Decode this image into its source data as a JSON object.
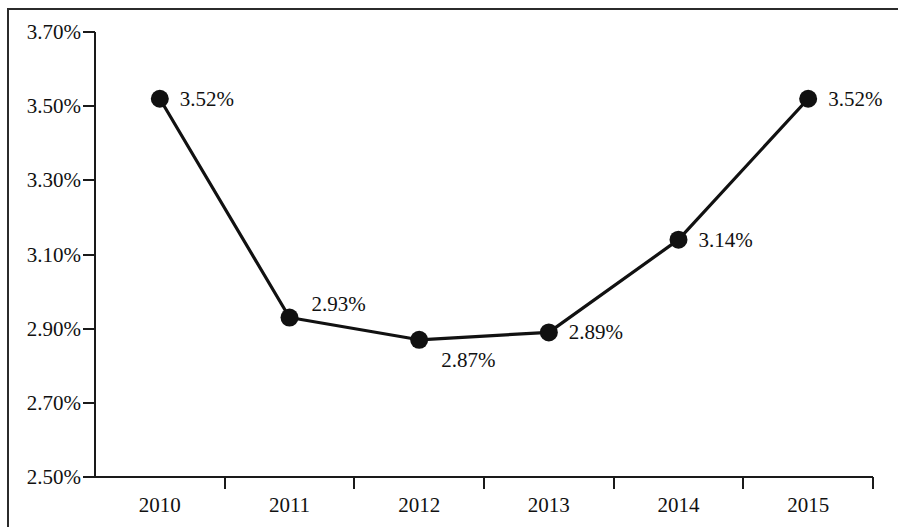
{
  "chart_data": {
    "type": "line",
    "title": "",
    "subtitle": "",
    "xlabel": "",
    "ylabel": "",
    "categories": [
      "2010",
      "2011",
      "2012",
      "2013",
      "2014",
      "2015"
    ],
    "values": [
      3.52,
      2.93,
      2.87,
      2.89,
      3.14,
      3.52
    ],
    "value_labels": [
      "3.52%",
      "2.93%",
      "2.87%",
      "2.89%",
      "3.14%",
      "3.52%"
    ],
    "series": [
      {
        "name": "",
        "values": [
          3.52,
          2.93,
          2.87,
          2.89,
          3.14,
          3.52
        ]
      }
    ],
    "ylim": [
      2.5,
      3.7
    ],
    "ytick_values": [
      3.7,
      3.5,
      3.3,
      3.1,
      2.9,
      2.7,
      2.5
    ],
    "ytick_labels": [
      "3.70%",
      "3.50%",
      "3.30%",
      "3.10%",
      "2.90%",
      "2.70%",
      "2.50%"
    ],
    "xtick_labels": [
      "2010",
      "2011",
      "2012",
      "2013",
      "2014",
      "2015"
    ],
    "grid": false,
    "legend": false,
    "legend_position": "none",
    "marker": "filled-circle",
    "line_color": "#111111",
    "marker_color": "#111111",
    "axis_color": "#1a1a1a",
    "background_color": "#ffffff",
    "unit": "%",
    "annotations": [
      {
        "category": "2010",
        "label": "3.52%",
        "placement": "right"
      },
      {
        "category": "2011",
        "label": "2.93%",
        "placement": "above-right"
      },
      {
        "category": "2012",
        "label": "2.87%",
        "placement": "below-right"
      },
      {
        "category": "2013",
        "label": "2.89%",
        "placement": "right"
      },
      {
        "category": "2014",
        "label": "3.14%",
        "placement": "right"
      },
      {
        "category": "2015",
        "label": "3.52%",
        "placement": "right"
      }
    ]
  }
}
